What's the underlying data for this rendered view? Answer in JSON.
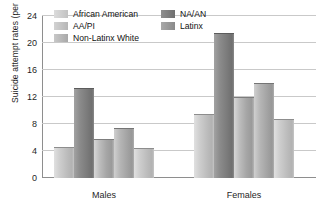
{
  "chart_data": {
    "type": "bar",
    "title": "",
    "xlabel": "",
    "ylabel": "Suicide attempt rates (per 100)",
    "categories": [
      "Males",
      "Females"
    ],
    "ylim": [
      0,
      24
    ],
    "yticks": [
      0,
      4,
      8,
      12,
      16,
      20,
      24
    ],
    "ytick_labels": [
      "0",
      "4",
      "8",
      "12",
      "16",
      "20",
      "24"
    ],
    "grid": true,
    "legend_position": "top-left-inside",
    "series": [
      {
        "name": "African American",
        "values": [
          4.5,
          9.4
        ],
        "swatch": "sw-1",
        "style": "light"
      },
      {
        "name": "AA/PI",
        "values": [
          5.7,
          11.9
        ],
        "swatch": "sw-2",
        "style": "bar"
      },
      {
        "name": "Non-Latinx White",
        "values": [
          7.3,
          14.0
        ],
        "swatch": "sw-3",
        "style": "mid"
      },
      {
        "name": "NA/AN",
        "values": [
          13.2,
          21.4
        ],
        "swatch": "sw-4",
        "style": "dark"
      },
      {
        "name": "Latinx",
        "values": [
          4.3,
          8.6
        ],
        "swatch": "sw-5",
        "style": "light"
      }
    ],
    "bar_order_in_group": [
      "African American",
      "NA/AN",
      "AA/PI",
      "Non-Latinx White",
      "Latinx"
    ]
  },
  "legend": {
    "items": [
      {
        "label": "African American"
      },
      {
        "label": "NA/AN"
      },
      {
        "label": "AA/PI"
      },
      {
        "label": "Latinx"
      },
      {
        "label": "Non-Latinx White"
      }
    ]
  },
  "axis": {
    "y_title": "Suicide attempt rates (per 100)",
    "ticks": [
      "24",
      "20",
      "16",
      "12",
      "8",
      "4",
      "0"
    ],
    "categories": [
      "Males",
      "Females"
    ]
  }
}
